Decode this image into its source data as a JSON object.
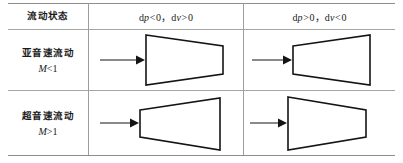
{
  "table": {
    "header": {
      "col_flow_state": "流动状态",
      "col_case_1": "dp<0，dv>0",
      "col_case_2": "dp>0，dv<0",
      "case_1_parts": {
        "d": "d",
        "p": "p",
        "rel1": "<",
        "zero1": "0",
        "sep": "，",
        "d2": "d",
        "v": "v",
        "rel2": ">",
        "zero2": "0"
      },
      "case_2_parts": {
        "d": "d",
        "p": "p",
        "rel1": ">",
        "zero1": "0",
        "sep": "，",
        "d2": "d",
        "v": "v",
        "rel2": "<",
        "zero2": "0"
      }
    },
    "rows": [
      {
        "label": "亚音速流动",
        "mach_symbol": "M",
        "mach_relation": "<",
        "mach_value": "1",
        "mach": "M<1",
        "cells": [
          {
            "shape": "converging",
            "arrow": "inflow-arrow",
            "description": "亚音速流动 dp<0 dv>0 渐缩管"
          },
          {
            "shape": "diverging",
            "arrow": "inflow-arrow",
            "description": "亚音速流动 dp>0 dv<0 渐扩管"
          }
        ]
      },
      {
        "label": "超音速流动",
        "mach_symbol": "M",
        "mach_relation": ">",
        "mach_value": "1",
        "mach": "M>1",
        "cells": [
          {
            "shape": "diverging",
            "arrow": "inflow-arrow",
            "description": "超音速流动 dp<0 dv>0 渐扩管"
          },
          {
            "shape": "converging",
            "arrow": "inflow-arrow",
            "description": "超音速流动 dp>0 dv<0 渐缩管"
          }
        ]
      }
    ]
  },
  "colors": {
    "rule": "#9a9a9a",
    "rule_strong": "#8d8d8d",
    "ink": "#141414",
    "background": "#ffffff"
  }
}
